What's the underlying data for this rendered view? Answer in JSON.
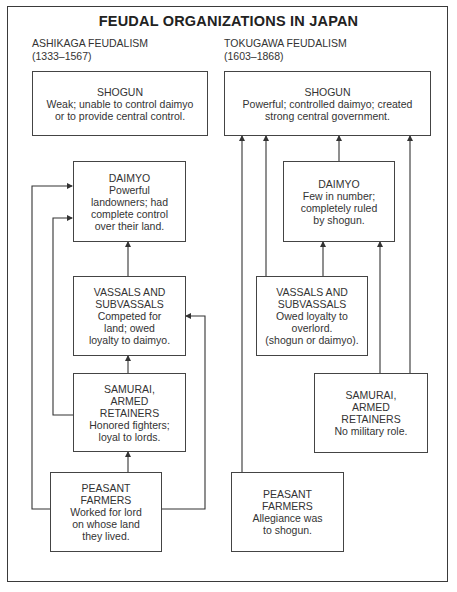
{
  "title": "FEUDAL ORGANIZATIONS IN JAPAN",
  "ashikaga": {
    "heading": "ASHIKAGA FEUDALISM",
    "years": "(1333–1567)",
    "shogun": {
      "title": "SHOGUN",
      "desc": "Weak; unable to control daimyo\nor to provide central control."
    },
    "daimyo": {
      "title": "DAIMYO",
      "desc": "Powerful\nlandowners; had\ncomplete control\nover their land."
    },
    "vassals": {
      "title": "VASSALS AND\nSUBVASSALS",
      "desc": "Competed for\nland; owed\nloyalty to daimyo."
    },
    "samurai": {
      "title": "SAMURAI,\nARMED\nRETAINERS",
      "desc": "Honored fighters;\nloyal to lords."
    },
    "peasants": {
      "title": "PEASANT\nFARMERS",
      "desc": "Worked for lord\non whose land\nthey lived."
    }
  },
  "tokugawa": {
    "heading": "TOKUGAWA FEUDALISM",
    "years": "(1603–1868)",
    "shogun": {
      "title": "SHOGUN",
      "desc": "Powerful; controlled daimyo; created\nstrong central government."
    },
    "daimyo": {
      "title": "DAIMYO",
      "desc": "Few in number;\ncompletely ruled\nby shogun."
    },
    "vassals": {
      "title": "VASSALS AND\nSUBVASSALS",
      "desc": "Owed loyalty to\noverlord.\n(shogun or daimyo)."
    },
    "samurai": {
      "title": "SAMURAI,\nARMED\nRETAINERS",
      "desc": "No military role."
    },
    "peasants": {
      "title": "PEASANT\nFARMERS",
      "desc": "Allegiance was\nto shogun."
    }
  },
  "connections": {
    "ashikaga": [
      "peasants -> samurai",
      "samurai -> vassals",
      "vassals -> daimyo",
      "peasants -> daimyo",
      "samurai -> daimyo",
      "peasants -> vassals"
    ],
    "tokugawa": [
      "peasants -> shogun",
      "vassals -> shogun",
      "vassals -> daimyo",
      "daimyo -> shogun",
      "samurai -> daimyo",
      "samurai -> shogun"
    ]
  },
  "colors": {
    "line": "#333333",
    "text": "#2a2a2a",
    "background": "#ffffff"
  }
}
